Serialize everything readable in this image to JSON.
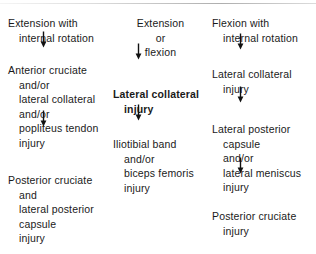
{
  "figure": {
    "arrow_glyph": "down-arrow",
    "columns": [
      {
        "id": "extension-internal-rotation",
        "align": "left",
        "nodes": [
          {
            "id": "mechanism",
            "bold": false,
            "lines": [
              {
                "text": "Extension with",
                "indent": false
              },
              {
                "text": "internal rotation",
                "indent": true
              }
            ]
          },
          {
            "id": "first-injury",
            "bold": false,
            "lines": [
              {
                "text": "Anterior cruciate",
                "indent": false
              },
              {
                "text": "and/or",
                "indent": true
              },
              {
                "text": "lateral collateral",
                "indent": true
              },
              {
                "text": "and/or",
                "indent": true
              },
              {
                "text": "popliteus tendon",
                "indent": true
              },
              {
                "text": "injury",
                "indent": true
              }
            ]
          },
          {
            "id": "second-injury",
            "bold": false,
            "lines": [
              {
                "text": "Posterior cruciate",
                "indent": false
              },
              {
                "text": "and",
                "indent": true
              },
              {
                "text": "lateral posterior",
                "indent": true
              },
              {
                "text": "capsule",
                "indent": true
              },
              {
                "text": "injury",
                "indent": true
              }
            ]
          }
        ]
      },
      {
        "id": "extension-or-flexion",
        "align": "center",
        "nodes": [
          {
            "id": "mechanism",
            "bold": false,
            "centered": true,
            "lines": [
              {
                "text": "Extension",
                "indent": false
              },
              {
                "text": "or",
                "indent": true
              },
              {
                "text": "flexion",
                "indent": true
              }
            ]
          },
          {
            "id": "first-injury",
            "bold": true,
            "lines": [
              {
                "text": "Lateral collateral",
                "indent": false
              },
              {
                "text": "injury",
                "indent": true
              }
            ]
          },
          {
            "id": "second-injury",
            "bold": false,
            "lines": [
              {
                "text": "Iliotibial band",
                "indent": false
              },
              {
                "text": "and/or",
                "indent": true
              },
              {
                "text": "biceps femoris",
                "indent": true
              },
              {
                "text": "injury",
                "indent": true
              }
            ]
          }
        ]
      },
      {
        "id": "flexion-internal-rotation",
        "align": "left",
        "nodes": [
          {
            "id": "mechanism",
            "bold": false,
            "lines": [
              {
                "text": "Flexion with",
                "indent": false
              },
              {
                "text": "internal rotation",
                "indent": true
              }
            ]
          },
          {
            "id": "first-injury",
            "bold": false,
            "lines": [
              {
                "text": "Lateral collateral",
                "indent": false
              },
              {
                "text": "injury",
                "indent": true
              }
            ]
          },
          {
            "id": "second-injury",
            "bold": false,
            "lines": [
              {
                "text": "Lateral posterior",
                "indent": false
              },
              {
                "text": "capsule",
                "indent": true
              },
              {
                "text": "and/or",
                "indent": true
              },
              {
                "text": "lateral meniscus",
                "indent": true
              },
              {
                "text": "injury",
                "indent": true
              }
            ]
          },
          {
            "id": "third-injury",
            "bold": false,
            "lines": [
              {
                "text": "Posterior cruciate",
                "indent": false
              },
              {
                "text": "injury",
                "indent": true
              }
            ]
          }
        ]
      }
    ]
  }
}
